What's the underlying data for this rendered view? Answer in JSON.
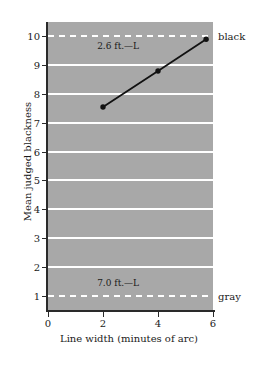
{
  "chart_data": {
    "type": "line",
    "title": "",
    "xlabel": "Line width (minutes of arc)",
    "ylabel": "Mean judged blackness",
    "xlim": [
      0,
      6
    ],
    "ylim": [
      0.5,
      10.5
    ],
    "grid": true,
    "legend_position": "none",
    "x": [
      2,
      4,
      5.75
    ],
    "series": [
      {
        "name": "judged blackness",
        "values": [
          7.55,
          8.8,
          9.9
        ],
        "color": "#111111",
        "marker": "circle"
      }
    ],
    "x_ticks": [
      0,
      2,
      4,
      6
    ],
    "x_tick_labels": [
      "0",
      "2",
      "4",
      "6"
    ],
    "y_ticks": [
      1,
      2,
      3,
      4,
      5,
      6,
      7,
      8,
      9,
      10
    ],
    "y_tick_labels": [
      "1",
      "2",
      "3",
      "4",
      "5",
      "6",
      "7",
      "8",
      "9",
      "10"
    ],
    "gridlines": [
      {
        "y": 1,
        "style": "dashed"
      },
      {
        "y": 2,
        "style": "solid"
      },
      {
        "y": 3,
        "style": "solid"
      },
      {
        "y": 4,
        "style": "solid"
      },
      {
        "y": 5,
        "style": "solid"
      },
      {
        "y": 6,
        "style": "solid"
      },
      {
        "y": 7,
        "style": "solid"
      },
      {
        "y": 8,
        "style": "solid"
      },
      {
        "y": 9,
        "style": "solid"
      },
      {
        "y": 10,
        "style": "dashed"
      }
    ],
    "annotations": [
      {
        "text": "2.6 ft.—L",
        "x": 2.55,
        "y": 9.62
      },
      {
        "text": "7.0 ft.—L",
        "x": 2.55,
        "y": 1.42
      }
    ],
    "side_labels": [
      {
        "text": "black",
        "y": 10
      },
      {
        "text": "gray",
        "y": 1
      }
    ],
    "colors": {
      "plot_background": "#a8a8a8",
      "gridline": "#ffffff",
      "axis": "#2a2a2a",
      "data": "#111111",
      "page_background": "#ffffff"
    }
  }
}
